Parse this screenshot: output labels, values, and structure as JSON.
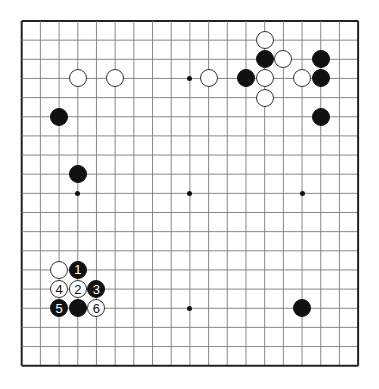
{
  "board": {
    "size": 19,
    "origin_x": 21.7,
    "origin_y": 21.0,
    "spacing_x": 18.69,
    "spacing_y": 19.15,
    "grid_color": "#7a7a7a",
    "border_color": "#222222",
    "star_points": [
      [
        3,
        3
      ],
      [
        9,
        3
      ],
      [
        15,
        3
      ],
      [
        3,
        9
      ],
      [
        9,
        9
      ],
      [
        15,
        9
      ],
      [
        3,
        15
      ],
      [
        9,
        15
      ],
      [
        15,
        15
      ]
    ],
    "stones": [
      {
        "color": "white",
        "col": 3,
        "row": 3,
        "label": ""
      },
      {
        "color": "white",
        "col": 5,
        "row": 3,
        "label": ""
      },
      {
        "color": "white",
        "col": 10,
        "row": 3,
        "label": ""
      },
      {
        "color": "black",
        "col": 12,
        "row": 3,
        "label": ""
      },
      {
        "color": "white",
        "col": 13,
        "row": 1,
        "label": ""
      },
      {
        "color": "black",
        "col": 13,
        "row": 2,
        "label": ""
      },
      {
        "color": "white",
        "col": 14,
        "row": 2,
        "label": ""
      },
      {
        "color": "white",
        "col": 13,
        "row": 3,
        "label": ""
      },
      {
        "color": "white",
        "col": 13,
        "row": 4,
        "label": ""
      },
      {
        "color": "white",
        "col": 15,
        "row": 3,
        "label": ""
      },
      {
        "color": "black",
        "col": 16,
        "row": 2,
        "label": ""
      },
      {
        "color": "black",
        "col": 16,
        "row": 3,
        "label": ""
      },
      {
        "color": "black",
        "col": 16,
        "row": 5,
        "label": ""
      },
      {
        "color": "black",
        "col": 2,
        "row": 5,
        "label": ""
      },
      {
        "color": "black",
        "col": 3,
        "row": 8,
        "label": ""
      },
      {
        "color": "white",
        "col": 2,
        "row": 13,
        "label": ""
      },
      {
        "color": "black",
        "col": 3,
        "row": 13,
        "label": "1"
      },
      {
        "color": "white",
        "col": 3,
        "row": 14,
        "label": "2"
      },
      {
        "color": "black",
        "col": 4,
        "row": 14,
        "label": "3"
      },
      {
        "color": "white",
        "col": 2,
        "row": 14,
        "label": "4"
      },
      {
        "color": "black",
        "col": 2,
        "row": 15,
        "label": "5"
      },
      {
        "color": "black",
        "col": 3,
        "row": 15,
        "label": ""
      },
      {
        "color": "white",
        "col": 4,
        "row": 15,
        "label": "6"
      },
      {
        "color": "black",
        "col": 15,
        "row": 15,
        "label": ""
      }
    ]
  }
}
